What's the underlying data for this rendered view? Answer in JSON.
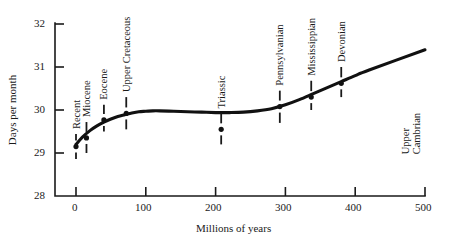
{
  "chart_data": {
    "type": "line",
    "title": "",
    "xlabel": "Millions of years",
    "ylabel": "Days per month",
    "xlim": [
      -30,
      500
    ],
    "ylim": [
      28,
      32
    ],
    "xticks": [
      0,
      100,
      200,
      300,
      400,
      500
    ],
    "yticks": [
      28,
      29,
      30,
      31,
      32
    ],
    "xtick_labels": [
      "0",
      "100",
      "200",
      "300",
      "400",
      "500"
    ],
    "ytick_labels": [
      "28",
      "29",
      "30",
      "31",
      "32"
    ],
    "grid": false,
    "legend": "none",
    "series": [
      {
        "name": "fitted curve",
        "style": "smooth-thick-line",
        "x": [
          0,
          10,
          20,
          30,
          40,
          50,
          60,
          70,
          80,
          90,
          100,
          110,
          120,
          140,
          160,
          180,
          200,
          210,
          220,
          240,
          260,
          280,
          300,
          320,
          340,
          360,
          380,
          400,
          420,
          500
        ],
        "y": [
          29.2,
          29.38,
          29.52,
          29.63,
          29.72,
          29.79,
          29.85,
          29.89,
          29.93,
          29.96,
          29.97,
          29.98,
          29.98,
          29.97,
          29.96,
          29.95,
          29.94,
          29.94,
          29.94,
          29.95,
          29.98,
          30.03,
          30.12,
          30.24,
          30.38,
          30.52,
          30.66,
          30.8,
          30.93,
          31.4
        ]
      }
    ],
    "data_points": [
      {
        "label": "Recent",
        "x": 0,
        "y": 29.15,
        "err_low": 28.86,
        "err_high": 29.44
      },
      {
        "label": "Miocene",
        "x": 15,
        "y": 29.35,
        "err_low": 29.0,
        "err_high": 29.72
      },
      {
        "label": "Eocene",
        "x": 40,
        "y": 29.77,
        "err_low": 29.5,
        "err_high": 30.12
      },
      {
        "label": "Upper Cretaceous",
        "x": 72,
        "y": 29.92,
        "err_low": 29.55,
        "err_high": 30.3
      },
      {
        "label": "Triassic",
        "x": 208,
        "y": 29.55,
        "err_low": 29.2,
        "err_high": 29.92
      },
      {
        "label": "Pennsylvanian",
        "x": 292,
        "y": 30.08,
        "err_low": 29.7,
        "err_high": 30.45
      },
      {
        "label": "Mississippian",
        "x": 337,
        "y": 30.3,
        "err_low": 30.0,
        "err_high": 30.68
      },
      {
        "label": "Devonian",
        "x": 380,
        "y": 30.62,
        "err_low": 30.3,
        "err_high": 31.0
      }
    ],
    "annotations": [
      {
        "text": "Upper Cambrian",
        "lines": [
          "Upper",
          "Cambrian"
        ],
        "x": 500,
        "y": 29.9,
        "rotated": true
      }
    ],
    "colors": {
      "axis": "#1a1a1a",
      "curve": "#111111",
      "marker": "#111111",
      "background": "#ffffff"
    }
  }
}
